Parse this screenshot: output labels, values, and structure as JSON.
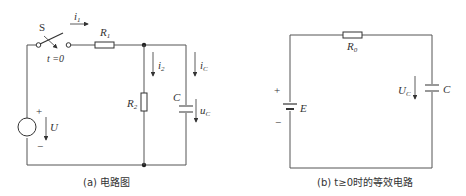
{
  "figure_a": {
    "caption": "(a) 电路图",
    "switch_label": "S",
    "switch_time": "t =0",
    "r1_label": "R",
    "r1_sub": "1",
    "r2_label": "R",
    "r2_sub": "2",
    "c_label": "C",
    "i1_label": "i",
    "i1_sub": "1",
    "i2_label": "i",
    "i2_sub": "2",
    "ic_label": "i",
    "ic_sub": "C",
    "uc_label": "u",
    "uc_sub": "C",
    "source_label": "U",
    "plus": "+",
    "minus": "−"
  },
  "figure_b": {
    "caption": "(b)  t≥0时的等效电路",
    "r0_label": "R",
    "r0_sub": "0",
    "c_label": "C",
    "uc_label": "U",
    "uc_sub": "C",
    "source_label": "E",
    "plus": "+",
    "minus": "−"
  }
}
